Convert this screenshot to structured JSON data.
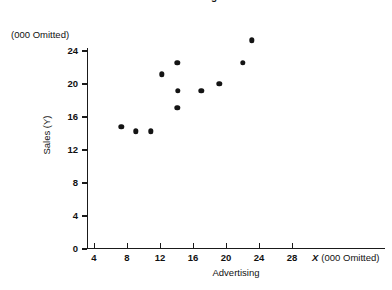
{
  "chart_data": {
    "type": "scatter",
    "title": "Scatter Diagram",
    "xlabel": "Advertising",
    "ylabel": "Sales (Y)",
    "x_unit_note": "X  (000 Omitted)",
    "x_unit_note_symbol": "X",
    "x_unit_note_text": "(000 Omitted)",
    "y_unit_note": "(000 Omitted)",
    "xlim": [
      0,
      32
    ],
    "ylim": [
      0,
      26
    ],
    "grid": false,
    "legend": null,
    "xticks": [
      4,
      8,
      12,
      16,
      20,
      24,
      28
    ],
    "yticks": [
      0,
      4,
      8,
      12,
      16,
      20,
      24
    ],
    "xtick_labels": [
      "4",
      "8",
      "12",
      "16",
      "20",
      "24",
      "28"
    ],
    "ytick_labels": [
      "0",
      "4",
      "8",
      "12",
      "16",
      "20",
      "24"
    ],
    "marker_color": "#141414",
    "axis_color": "#1a1a1a",
    "points": [
      {
        "x": 7.3,
        "y": 14.7
      },
      {
        "x": 9.1,
        "y": 14.2
      },
      {
        "x": 10.9,
        "y": 14.2
      },
      {
        "x": 12.2,
        "y": 21.1
      },
      {
        "x": 14.1,
        "y": 22.5
      },
      {
        "x": 14.2,
        "y": 19.1
      },
      {
        "x": 14.1,
        "y": 17.0
      },
      {
        "x": 17.0,
        "y": 19.1
      },
      {
        "x": 19.2,
        "y": 19.9
      },
      {
        "x": 22.0,
        "y": 22.5
      },
      {
        "x": 23.1,
        "y": 25.2
      }
    ]
  }
}
